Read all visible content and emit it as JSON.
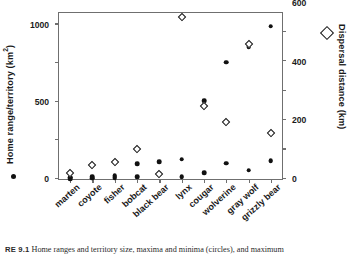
{
  "figure": {
    "caption_label": "RE 9.1",
    "caption_text": "Home ranges and territory size, maxima and minima (circles), and maximum"
  },
  "legend": {
    "circle_marker": "filled-circle",
    "diamond_marker": "open-diamond",
    "circle_meaning": "Home range/territory maxima and minima",
    "diamond_meaning": "Maximum dispersal distance"
  },
  "chart_data": {
    "type": "scatter",
    "title": "",
    "xlabel": "",
    "ylabel": "Home range/territory (km2)",
    "y2label": "Dispersal distance (km)",
    "grid": false,
    "legend_position": "axis-titles",
    "categories": [
      "marten",
      "coyote",
      "fisher",
      "bobcat",
      "black bear",
      "lynx",
      "cougar",
      "wolverine",
      "gray wolf",
      "grizzly bear"
    ],
    "ylim": [
      0,
      2150
    ],
    "yticks": [
      0,
      500,
      1000,
      1500,
      2000
    ],
    "y2lim": [
      0,
      1130
    ],
    "y2ticks": [
      0,
      200,
      400,
      600,
      800,
      1000
    ],
    "series": [
      {
        "name": "Home range/territory maximum",
        "marker": "filled-circle",
        "axis": "left",
        "unit": "km2",
        "values": [
          22,
          30,
          38,
          200,
          225,
          255,
          1010,
          1510,
          1710,
          1980
        ]
      },
      {
        "name": "Home range/territory minimum",
        "marker": "filled-circle",
        "axis": "left",
        "unit": "km2",
        "values": [
          6,
          10,
          14,
          25,
          68,
          30,
          80,
          205,
          115,
          235
        ]
      },
      {
        "name": "Maximum dispersal distance",
        "marker": "open-diamond",
        "axis": "right",
        "unit": "km",
        "values": [
          40,
          95,
          113,
          203,
          36,
          1100,
          495,
          390,
          920,
          313
        ]
      }
    ]
  }
}
